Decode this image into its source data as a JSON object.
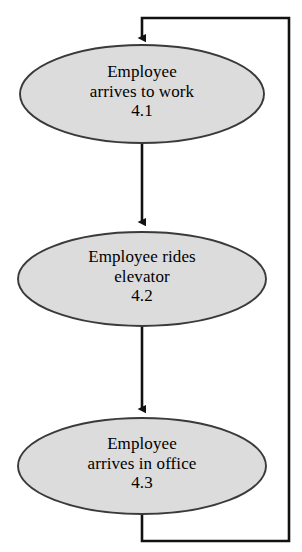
{
  "diagram": {
    "type": "flowchart",
    "orientation": "vertical",
    "colors": {
      "node_fill": "#dcdcdc",
      "node_stroke": "#3a3a3a",
      "connector": "#111111",
      "text": "#000000",
      "background": "#ffffff"
    }
  },
  "nodes": [
    {
      "id": "4.1",
      "shape": "ellipse",
      "line1": "Employee",
      "line2": "arrives to work",
      "line3": "4.1",
      "cx": 142,
      "cy": 94,
      "rx": 122,
      "ry": 49
    },
    {
      "id": "4.2",
      "shape": "ellipse",
      "line1": "Employee rides",
      "line2": "elevator",
      "line3": "4.2",
      "cx": 142,
      "cy": 279,
      "rx": 124,
      "ry": 47
    },
    {
      "id": "4.3",
      "shape": "ellipse",
      "line1": "Employee",
      "line2": "arrives in office",
      "line3": "4.3",
      "cx": 142,
      "cy": 466,
      "rx": 124,
      "ry": 48
    }
  ],
  "connectors": [
    {
      "id": "edge-4-1-to-4-2",
      "from": "4.1",
      "to": "4.2",
      "kind": "straight-down",
      "arrowhead": true
    },
    {
      "id": "edge-4-2-to-4-3",
      "from": "4.2",
      "to": "4.3",
      "kind": "straight-down",
      "arrowhead": true
    },
    {
      "id": "edge-feedback-loop",
      "from": "4.3",
      "to": "4.1",
      "kind": "loop-right",
      "arrowhead": true
    }
  ]
}
